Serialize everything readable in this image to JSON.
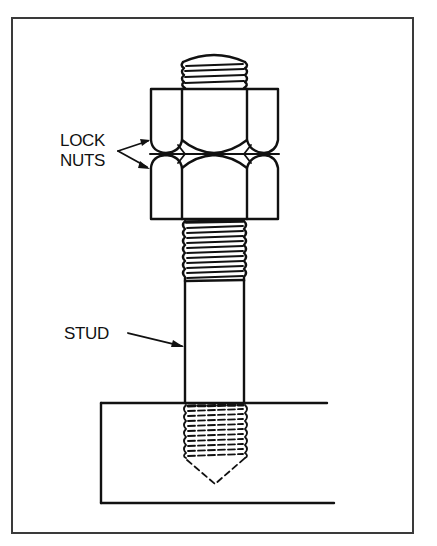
{
  "diagram": {
    "type": "mechanical-drawing",
    "labels": {
      "lock_nuts_line1": "LOCK",
      "lock_nuts_line2": "NUTS",
      "stud": "STUD"
    },
    "components": [
      {
        "name": "stud",
        "features": [
          "threaded top end",
          "plain shank",
          "threaded bottom end"
        ]
      },
      {
        "name": "upper lock nut",
        "shape": "hexagonal"
      },
      {
        "name": "lower lock nut",
        "shape": "hexagonal"
      },
      {
        "name": "base block",
        "features": [
          "tapped hole (hidden lines)",
          "drill point"
        ]
      }
    ],
    "colors": {
      "line": "#111111",
      "frame": "#3a3a3a",
      "background": "#ffffff"
    }
  }
}
